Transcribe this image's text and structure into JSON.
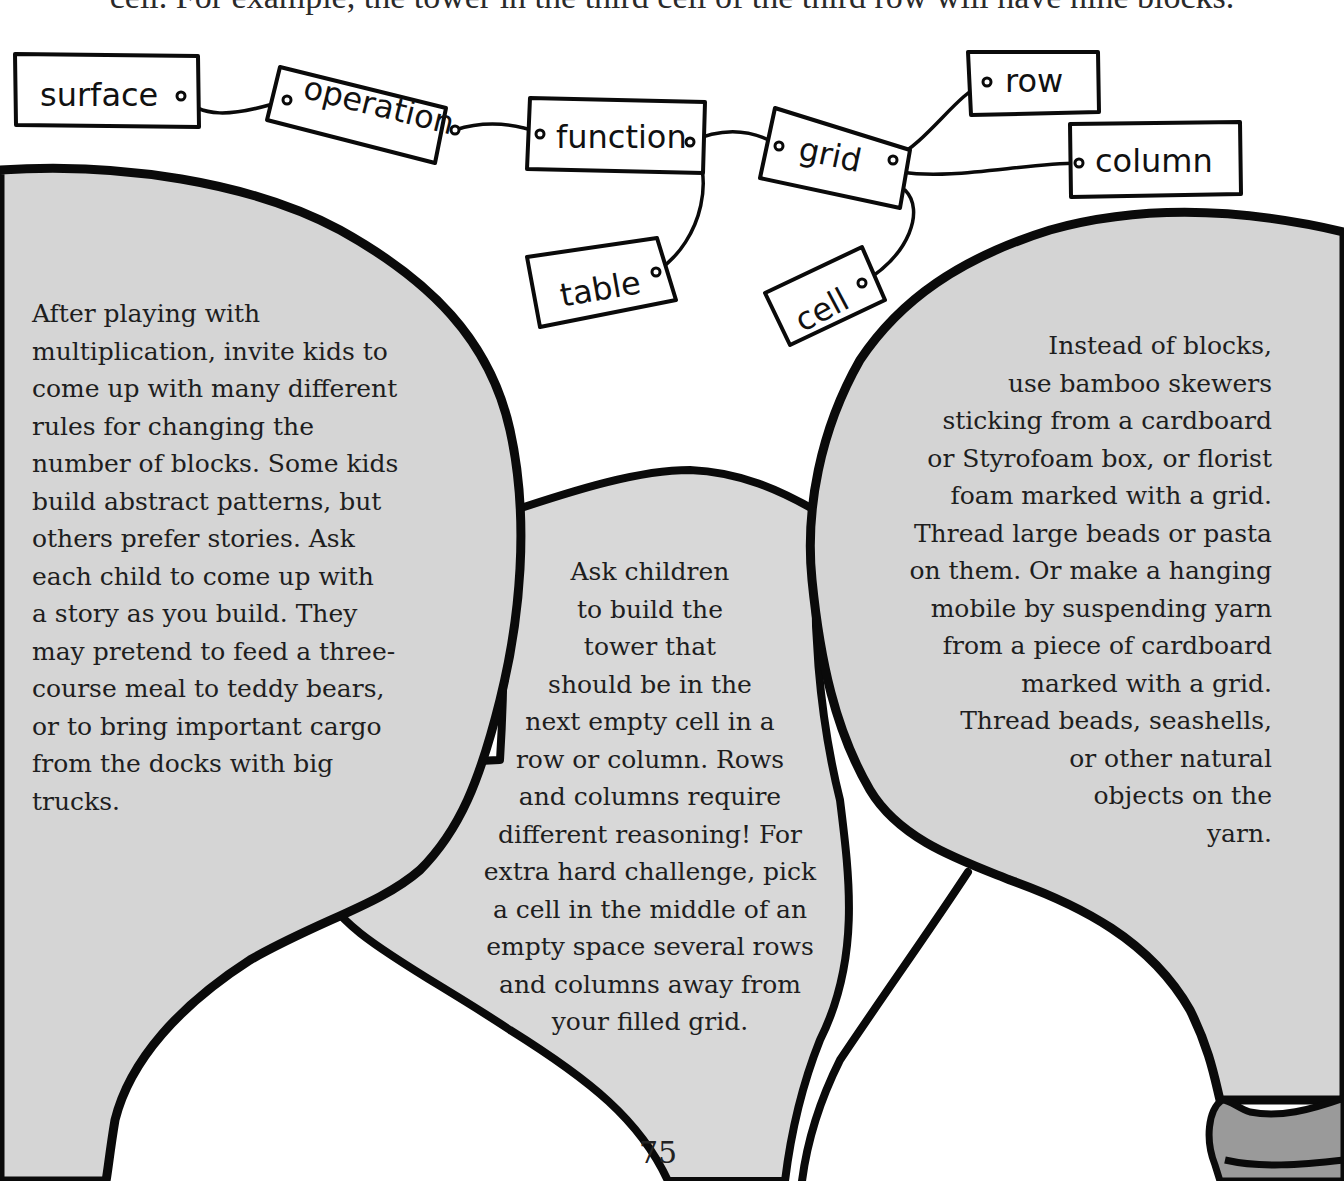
{
  "page": {
    "top_text_partial": "cell. For example, the tower in the third cell of the third row will have nine blocks.",
    "page_number": "75"
  },
  "concept_map": {
    "nodes": [
      {
        "id": "surface",
        "label": "surface"
      },
      {
        "id": "operation",
        "label": "operation"
      },
      {
        "id": "function",
        "label": "function"
      },
      {
        "id": "table",
        "label": "table"
      },
      {
        "id": "grid",
        "label": "grid"
      },
      {
        "id": "cell",
        "label": "cell"
      },
      {
        "id": "row",
        "label": "row"
      },
      {
        "id": "column",
        "label": "column"
      }
    ],
    "edges": [
      [
        "surface",
        "operation"
      ],
      [
        "operation",
        "function"
      ],
      [
        "function",
        "table"
      ],
      [
        "function",
        "grid"
      ],
      [
        "grid",
        "row"
      ],
      [
        "grid",
        "column"
      ],
      [
        "grid",
        "cell"
      ]
    ]
  },
  "balloons": {
    "left": {
      "lines": [
        "After playing with",
        "multiplication, invite kids to",
        "come up with many different",
        "rules for changing the",
        "number of blocks. Some kids",
        "build abstract patterns, but",
        "others prefer stories. Ask",
        "each child to come up with",
        "a story as you build. They",
        "may pretend to feed a three-",
        "course meal to teddy bears,",
        "or to bring important cargo",
        "from the docks with big",
        "trucks."
      ]
    },
    "center": {
      "lines": [
        "Ask children",
        "to build the",
        "tower that",
        "should be in the",
        "next empty cell in a",
        "row or column. Rows",
        "and columns require",
        "different reasoning! For",
        "extra hard challenge, pick",
        "a cell in the middle of an",
        "empty space several rows",
        "and columns away from",
        "your filled grid."
      ]
    },
    "right": {
      "lines": [
        "Instead of blocks,",
        "use bamboo skewers",
        "sticking from a cardboard",
        "or Styrofoam box, or florist",
        "foam marked with a grid.",
        "Thread large beads or pasta",
        "on them. Or make a hanging",
        "mobile by suspending yarn",
        "from a piece of cardboard",
        "marked with a grid.",
        "Thread beads, seashells,",
        "or other natural",
        "objects on the",
        "yarn."
      ]
    }
  },
  "colors": {
    "balloon_fill": "#d6d6d6",
    "outline": "#0a0a0a",
    "basket_fill": "#9a9a9a",
    "background": "#ffffff"
  }
}
